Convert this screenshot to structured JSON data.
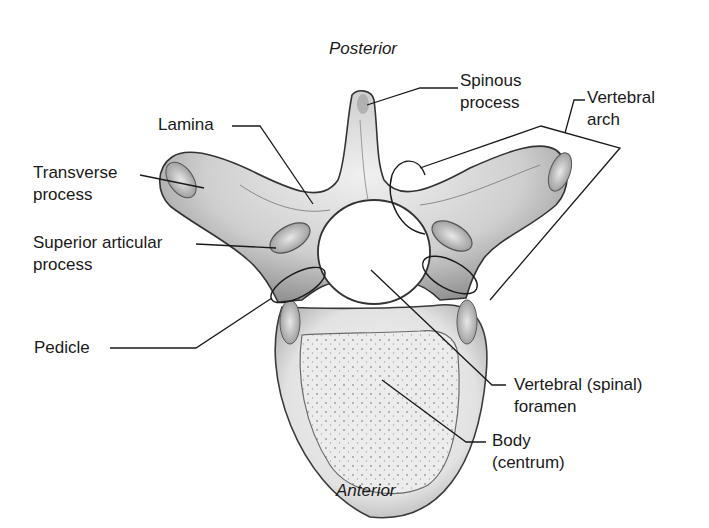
{
  "figure": {
    "orientation": {
      "top": "Posterior",
      "bottom": "Anterior"
    },
    "labels": [
      {
        "id": "spinous",
        "line1": "Spinous",
        "line2": "process"
      },
      {
        "id": "vertebral-arch",
        "line1": "Vertebral",
        "line2": "arch"
      },
      {
        "id": "lamina",
        "line1": "Lamina",
        "line2": ""
      },
      {
        "id": "transverse",
        "line1": "Transverse",
        "line2": "process"
      },
      {
        "id": "superior-articular",
        "line1": "Superior articular",
        "line2": "process"
      },
      {
        "id": "pedicle",
        "line1": "Pedicle",
        "line2": ""
      },
      {
        "id": "foramen",
        "line1": "Vertebral (spinal)",
        "line2": "foramen"
      },
      {
        "id": "body",
        "line1": "Body",
        "line2": "(centrum)"
      }
    ],
    "colors": {
      "background": "#ffffff",
      "ink": "#1a1a1a",
      "bone_light": "#e6e6e6",
      "bone_mid": "#bdbdbd",
      "bone_dark": "#6e6e6e"
    }
  }
}
